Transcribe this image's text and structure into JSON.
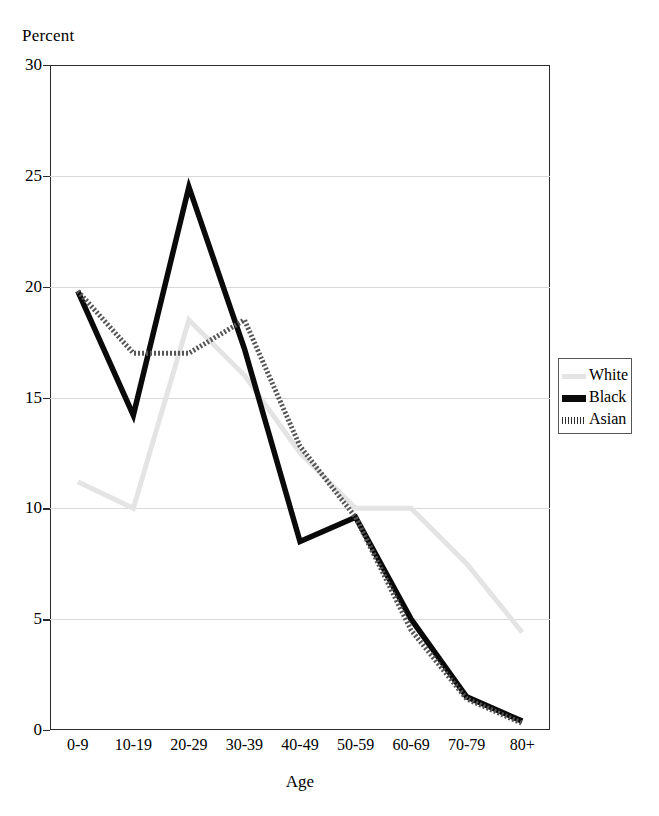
{
  "figure": {
    "y_axis_title": "Percent",
    "x_axis_title": "Age"
  },
  "legend": {
    "items": [
      {
        "label": "White",
        "color": "#e4e4e4",
        "style": "light-solid"
      },
      {
        "label": "Black",
        "color": "#0a0a0a",
        "style": "thick-solid"
      },
      {
        "label": "Asian",
        "color": "#555555",
        "style": "dotted-thick"
      }
    ]
  },
  "chart_data": {
    "type": "line",
    "title": "",
    "xlabel": "Age",
    "ylabel": "Percent",
    "categories": [
      "0-9",
      "10-19",
      "20-29",
      "30-39",
      "40-49",
      "50-59",
      "60-69",
      "70-79",
      "80+"
    ],
    "ylim": [
      0,
      30
    ],
    "yticks": [
      0,
      5,
      10,
      15,
      20,
      25,
      30
    ],
    "grid": true,
    "legend_position": "right",
    "series": [
      {
        "name": "White",
        "color": "#e4e4e4",
        "values": [
          11.2,
          10.0,
          18.5,
          16.0,
          12.5,
          10.0,
          10.0,
          7.5,
          4.4
        ]
      },
      {
        "name": "Black",
        "color": "#0a0a0a",
        "values": [
          19.8,
          14.2,
          24.5,
          17.2,
          8.5,
          9.6,
          5.0,
          1.5,
          0.4
        ]
      },
      {
        "name": "Asian",
        "color": "#555555",
        "values": [
          19.8,
          17.0,
          17.0,
          18.5,
          12.8,
          9.6,
          4.5,
          1.4,
          0.3
        ]
      }
    ]
  }
}
